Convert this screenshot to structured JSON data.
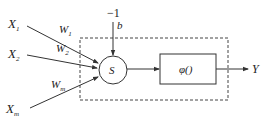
{
  "diagram": {
    "type": "neuron-model",
    "colors": {
      "stroke": "#333333",
      "background": "#ffffff",
      "text": "#222222"
    },
    "inputs": [
      {
        "name": "X",
        "sub": "1",
        "weight": "W",
        "weight_sub": "1"
      },
      {
        "name": "X",
        "sub": "2",
        "weight": "W",
        "weight_sub": "2"
      },
      {
        "name": "X",
        "sub": "m",
        "weight": "W",
        "weight_sub": "m"
      }
    ],
    "bias": {
      "input": "−1",
      "label": "b"
    },
    "summation": {
      "label": "S"
    },
    "activation": {
      "label": "φ()"
    },
    "output": {
      "label": "Y"
    }
  }
}
